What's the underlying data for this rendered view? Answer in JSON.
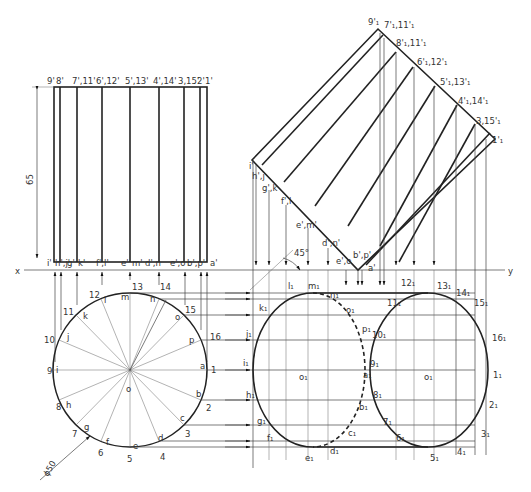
{
  "dimensions": {
    "height": "65",
    "diameter": "ϕ50",
    "angle": "45°"
  },
  "reference_line": {
    "x_label": "x",
    "y_label": "y"
  },
  "front_view": {
    "top_labels": [
      "9'",
      "8'",
      "7',11'",
      "6',12'",
      "5',13'",
      "4',14'",
      "3,15'",
      "2'",
      "1'"
    ],
    "bottom_labels": [
      "i'",
      "h',j'",
      "g'",
      "k'",
      "f',l'",
      "e'",
      "m'",
      "d',n",
      "e',o",
      "b',p'",
      "a'"
    ]
  },
  "top_view": {
    "outer_labels": [
      "1",
      "2",
      "3",
      "4",
      "5",
      "6",
      "7",
      "8",
      "9",
      "10",
      "11",
      "12",
      "13",
      "14",
      "15",
      "16"
    ],
    "inner_labels": [
      "a",
      "b",
      "c",
      "d",
      "e",
      "f",
      "g",
      "h",
      "i",
      "j",
      "k",
      "l",
      "m",
      "n",
      "o",
      "p"
    ],
    "center_label": "o"
  },
  "aux_front_view": {
    "labels": [
      "9'₁",
      "7'₁,11'₁",
      "8'₁,11'₁",
      "6'₁,12'₁",
      "5'₁,13'₁",
      "4'₁,14'₁",
      "3,15'₁",
      "1'₁"
    ],
    "lower_labels": [
      "i'",
      "h',j",
      "g',k",
      "f',l",
      "e',m'",
      "d',n'",
      "e',o",
      "b',p'",
      "a'"
    ]
  },
  "aux_top_view": {
    "left_labels": [
      "l₁",
      "m₁",
      "n₁",
      "k₁",
      "o₁",
      "j₁",
      "p₁",
      "i₁",
      "o₁",
      "a₁",
      "h₁",
      "b₁",
      "g₁",
      "c₁",
      "f₁",
      "d₁",
      "e₁"
    ],
    "right_labels": [
      "12₁",
      "13₁",
      "14₁",
      "11₁",
      "15₁",
      "10₁",
      "16₁",
      "9₁",
      "o₁",
      "1₁",
      "8₁",
      "2₁",
      "7₁",
      "3₁",
      "6₁",
      "4₁",
      "5₁"
    ]
  }
}
